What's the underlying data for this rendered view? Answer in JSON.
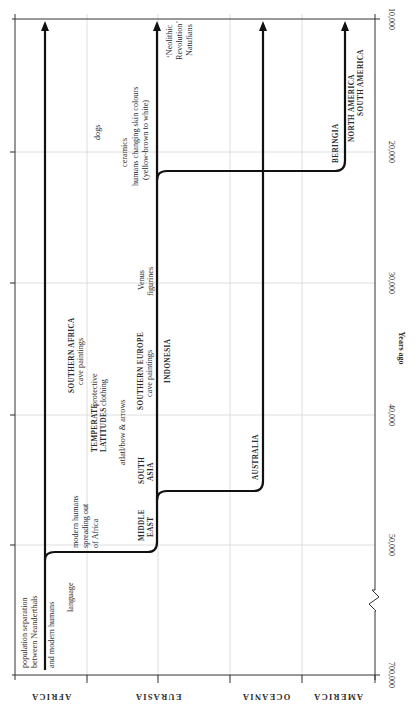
{
  "figure": {
    "orientation": "rotated 90deg; time runs right-to-left along the vertical page axis (top = recent)",
    "y_axis": {
      "title": "Years ago",
      "ticks": [
        "10,000",
        "20,000",
        "30,000",
        "40,000",
        "50,000",
        "700,000"
      ],
      "break_between": [
        "50,000",
        "700,000"
      ]
    },
    "regions": [
      "AFRICA",
      "EURASIA",
      "OCEANIA",
      "AMERICA"
    ],
    "events": {
      "africa": {
        "population_separation": [
          "population separation",
          "between Neanderthals",
          "and modern humans"
        ],
        "language": "language",
        "modern_humans": [
          "modern humans",
          "spreading out",
          "of Africa"
        ],
        "southern_africa": "SOUTHERN AFRICA",
        "southern_africa_sub": "cave paintings",
        "dogs": "dogs",
        "ceramics": "ceramics",
        "skin_colours": [
          "humans changing skin colours",
          "(yellow-brown to white)"
        ],
        "temperate": [
          "TEMPERATE",
          "LATITUDES"
        ],
        "protective_clothing": [
          "protective",
          "clothing"
        ],
        "atlatl": "atlatl/bow & arrows"
      },
      "eurasia": {
        "middle_east": [
          "MIDDLE",
          "EAST"
        ],
        "south_asia": [
          "SOUTH",
          "ASIA"
        ],
        "southern_europe": "SOUTHERN EUROPE",
        "southern_europe_sub": "cave paintings",
        "indonesia": "INDONESIA",
        "venus": [
          "Venus",
          "figurines"
        ],
        "neolithic": [
          "‘Neolithic",
          "Revolution’",
          "Natufians"
        ]
      },
      "oceania": {
        "australia": "AUSTRALIA"
      },
      "america": {
        "beringia": "BERINGIA",
        "north_america": "NORTH AMERICA",
        "south_america": "SOUTH AMERICA"
      }
    }
  }
}
